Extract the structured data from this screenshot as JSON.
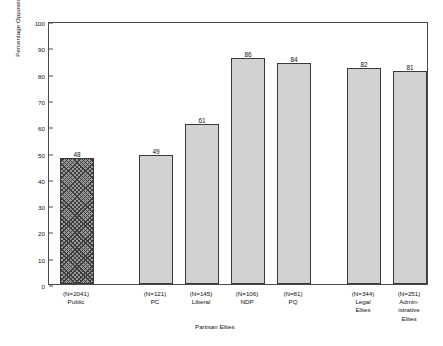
{
  "chart_data": {
    "type": "bar",
    "title": "",
    "subtitle": "",
    "xlabel": "Partisan Elites",
    "ylabel": "Percentage Opposed to Censorship",
    "ylim": [
      0,
      100
    ],
    "yticks": [
      0,
      10,
      20,
      30,
      40,
      50,
      60,
      70,
      80,
      90,
      100
    ],
    "grid": false,
    "legend": "none",
    "categories": [
      "Public",
      "PC",
      "Liberal",
      "NDP",
      "PQ",
      "Legal Elites",
      "Administrative Elites"
    ],
    "values": [
      48,
      49,
      61,
      86,
      84,
      82,
      81
    ],
    "sample_sizes": [
      "(N=2041)",
      "(N=121)",
      "(N=145)",
      "(N=106)",
      "(N=81)",
      "(N=344)",
      "(N=251)"
    ],
    "bar_fill": "#d2d2d2",
    "bar_edge": "#3a3a3a",
    "hatched_bars": [
      "Public"
    ],
    "axis_color": "#4a4a4a",
    "points": [
      {
        "label": "Public",
        "n": "(N=2041)",
        "lines": [
          "Public"
        ],
        "value": 48,
        "hatched": true
      },
      {
        "label": "PC",
        "n": "(N=121)",
        "lines": [
          "PC"
        ],
        "value": 49,
        "hatched": false
      },
      {
        "label": "Liberal",
        "n": "(N=145)",
        "lines": [
          "Liberal"
        ],
        "value": 61,
        "hatched": false
      },
      {
        "label": "NDP",
        "n": "(N=106)",
        "lines": [
          "NDP"
        ],
        "value": 86,
        "hatched": false
      },
      {
        "label": "PQ",
        "n": "(N=81)",
        "lines": [
          "PQ"
        ],
        "value": 84,
        "hatched": false
      },
      {
        "label": "Legal Elites",
        "n": "(N=344)",
        "lines": [
          "Legal",
          "Elites"
        ],
        "value": 82,
        "hatched": false
      },
      {
        "label": "Administrative Elites",
        "n": "(N=251)",
        "lines": [
          "Admin-",
          "istrative",
          "Elites"
        ],
        "value": 81,
        "hatched": false
      }
    ]
  },
  "axis": {
    "y_title": "Percentage Opposed to Censorship",
    "x_caption": "Partisan Elites",
    "ticks": [
      "0",
      "10",
      "20",
      "30",
      "40",
      "50",
      "60",
      "70",
      "80",
      "90",
      "100"
    ]
  }
}
